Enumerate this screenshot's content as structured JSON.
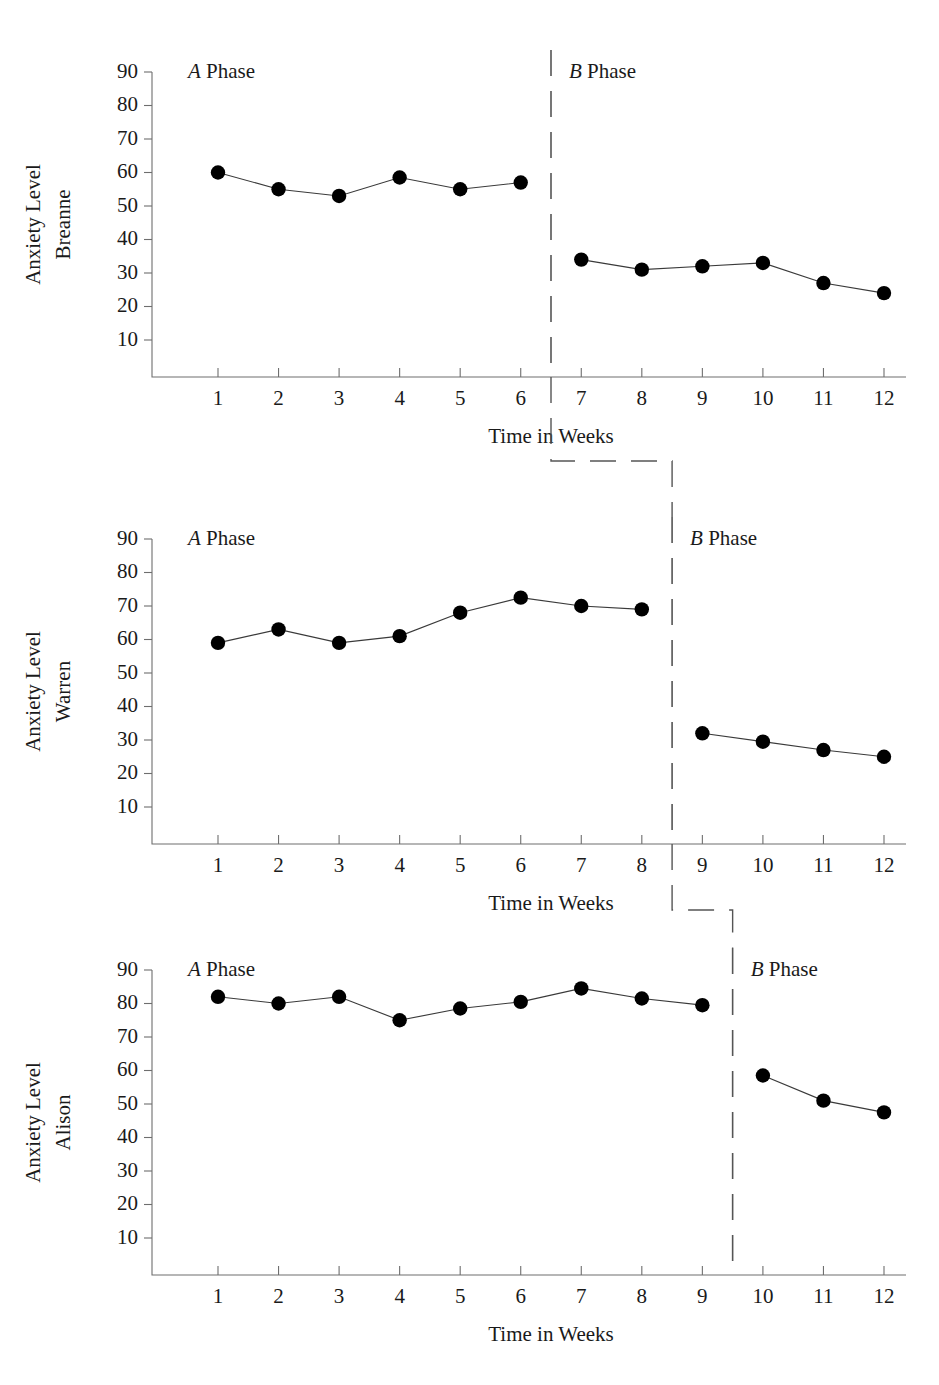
{
  "chart_data": {
    "type": "line",
    "title": "",
    "xlabel": "Time in Weeks",
    "ylabel": "Anxiety Level",
    "xlim": [
      0,
      13
    ],
    "ylim": [
      0,
      90
    ],
    "x_ticks": [
      1,
      2,
      3,
      4,
      5,
      6,
      7,
      8,
      9,
      10,
      11,
      12
    ],
    "y_ticks": [
      10,
      20,
      30,
      40,
      50,
      60,
      70,
      80,
      90
    ],
    "grid": false,
    "legend": "none",
    "design": "multiple-baseline AB design across three participants",
    "panels": [
      {
        "participant": "Breanne",
        "ylabel_line1": "Anxiety Level",
        "ylabel_line2": "Breanne",
        "xlabel": "Time in Weeks",
        "phase_a_label_italic": "A",
        "phase_a_label_rest": " Phase",
        "phase_b_label_italic": "B",
        "phase_b_label_rest": " Phase",
        "phase_change_at": 6.5,
        "series": [
          {
            "name": "A Phase",
            "x": [
              1,
              2,
              3,
              4,
              5,
              6
            ],
            "values": [
              60,
              55,
              53,
              58.5,
              55,
              57
            ]
          },
          {
            "name": "B Phase",
            "x": [
              7,
              8,
              9,
              10,
              11,
              12
            ],
            "values": [
              34,
              31,
              32,
              33,
              27,
              24
            ]
          }
        ]
      },
      {
        "participant": "Warren",
        "ylabel_line1": "Anxiety Level",
        "ylabel_line2": "Warren",
        "xlabel": "Time in Weeks",
        "phase_a_label_italic": "A",
        "phase_a_label_rest": " Phase",
        "phase_b_label_italic": "B",
        "phase_b_label_rest": " Phase",
        "phase_change_at": 8.5,
        "series": [
          {
            "name": "A Phase",
            "x": [
              1,
              2,
              3,
              4,
              5,
              6,
              7,
              8
            ],
            "values": [
              59,
              63,
              59,
              61,
              68,
              72.5,
              70,
              69
            ]
          },
          {
            "name": "B Phase",
            "x": [
              9,
              10,
              11,
              12
            ],
            "values": [
              32,
              29.5,
              27,
              25
            ]
          }
        ]
      },
      {
        "participant": "Alison",
        "ylabel_line1": "Anxiety Level",
        "ylabel_line2": "Alison",
        "xlabel": "Time in Weeks",
        "phase_a_label_italic": "A",
        "phase_a_label_rest": " Phase",
        "phase_b_label_italic": "B",
        "phase_b_label_rest": " Phase",
        "phase_change_at": 9.5,
        "series": [
          {
            "name": "A Phase",
            "x": [
              1,
              2,
              3,
              4,
              5,
              6,
              7,
              8,
              9
            ],
            "values": [
              82,
              80,
              82,
              75,
              78.5,
              80.5,
              84.5,
              81.5,
              79.5
            ]
          },
          {
            "name": "B Phase",
            "x": [
              10,
              11,
              12
            ],
            "values": [
              58.5,
              51,
              47.5
            ]
          }
        ]
      }
    ]
  },
  "colors": {
    "marker": "#000000",
    "series_line": "#3a3a3a",
    "axis": "#6e6e6e",
    "phase_line": "#555555",
    "background": "#ffffff"
  }
}
